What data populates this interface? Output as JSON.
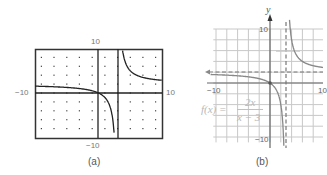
{
  "figure_a": {
    "caption": "(a)",
    "window": {
      "xmin": -10,
      "xmax": 10,
      "ymin": -10,
      "ymax": 10
    },
    "labels": {
      "top": "10",
      "bottom": "−10",
      "left": "−10",
      "right": "10"
    },
    "description": "Graphing calculator display of f(x) = 2x/(x-3)"
  },
  "figure_b": {
    "caption": "(b)",
    "axis_label_y": "y",
    "labels": {
      "top": "10",
      "bottom": "−10",
      "left": "−10",
      "right": "10"
    },
    "function_label": {
      "lhs": "f(x) =",
      "numerator": "2x",
      "denominator": "x − 3"
    },
    "asymptotes": {
      "vertical": "x = 3",
      "horizontal": "y = 2"
    }
  },
  "chart_data": [
    {
      "type": "line",
      "title": "(a) calculator graph",
      "function": "f(x) = 2x/(x-3)",
      "xlim": [
        -10,
        10
      ],
      "ylim": [
        -10,
        10
      ],
      "grid": "dots",
      "vertical_asymptote": 3
    },
    {
      "type": "line",
      "title": "(b) hand graph",
      "function": "f(x) = 2x/(x-3)",
      "xlim": [
        -10,
        10
      ],
      "ylim": [
        -10,
        10
      ],
      "grid": true,
      "vertical_asymptote": 3,
      "horizontal_asymptote": 2,
      "points": [
        {
          "x": 0,
          "y": 0
        }
      ]
    }
  ]
}
